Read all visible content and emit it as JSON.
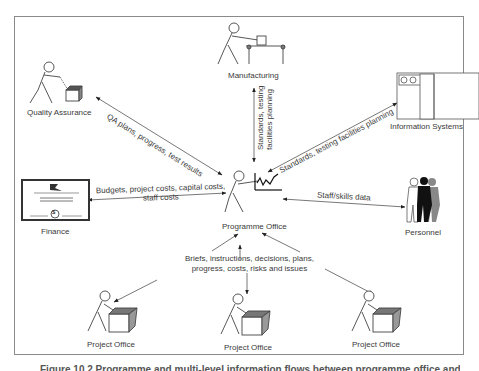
{
  "diagram": {
    "center": {
      "label": "Programme Office"
    },
    "nodes": [
      {
        "id": "qa",
        "label": "Quality Assurance"
      },
      {
        "id": "manufacturing",
        "label": "Manufacturing"
      },
      {
        "id": "is",
        "label": "Information Systems"
      },
      {
        "id": "finance",
        "label": "Finance"
      },
      {
        "id": "personnel",
        "label": "Personnel"
      },
      {
        "id": "po1",
        "label": "Project Office"
      },
      {
        "id": "po2",
        "label": "Project Office"
      },
      {
        "id": "po3",
        "label": "Project Office"
      }
    ],
    "edges": [
      {
        "from": "qa",
        "to": "center",
        "label": "QA plans, progress, test results"
      },
      {
        "from": "manufacturing",
        "to": "center",
        "label_line1": "Standards, testing",
        "label_line2": "facilities planning"
      },
      {
        "from": "is",
        "to": "center",
        "label": "Standards, testing facilities planning"
      },
      {
        "from": "finance",
        "to": "center",
        "label_line1": "Budgets, project costs, capital costs,",
        "label_line2": "staff costs"
      },
      {
        "from": "personnel",
        "to": "center",
        "label": "Staff/skills data"
      },
      {
        "from": "projects",
        "to": "center",
        "label_line1": "Briefs, instructions, decisions, plans,",
        "label_line2": "progress, costs, risks and issues"
      }
    ],
    "certificate_symbol": "$"
  },
  "caption": "Figure 10.2  Programme and multi-level information flows between programme office and other functions"
}
